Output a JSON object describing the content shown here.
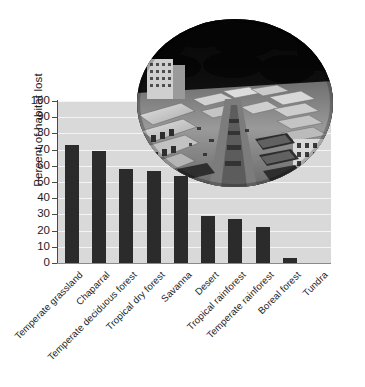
{
  "chart_data": {
    "type": "bar",
    "title": "",
    "xlabel": "",
    "ylabel": "Percent of habitat lost",
    "ylim": [
      0,
      100
    ],
    "ytick_step": 10,
    "yticks": [
      100,
      90,
      80,
      70,
      60,
      50,
      40,
      30,
      20,
      10,
      0
    ],
    "grid": "horizontal",
    "legend": "none",
    "categories": [
      "Temperate grassland",
      "Chaparral",
      "Temperate deciduous forest",
      "Tropical dry forest",
      "Savanna",
      "Desert",
      "Tropical rainforest",
      "Temperate rainforest",
      "Boreal forest",
      "Tundra"
    ],
    "values": [
      73,
      69,
      58,
      57,
      54,
      29,
      27,
      22,
      3,
      0
    ],
    "series": [
      {
        "name": "Percent of habitat lost",
        "values": [
          73,
          69,
          58,
          57,
          54,
          29,
          27,
          22,
          3,
          0
        ]
      }
    ],
    "bar_color": "#2b2b2b",
    "plot_background": "#d9d9d9",
    "gridline_color": "#f4f4f4"
  },
  "inset": {
    "name": "habitat-loss-photo",
    "shape": "ellipse",
    "description": "Black and white aerial photograph of urban construction clearing at a forest edge",
    "palette": {
      "canopy": "#0d0d0d",
      "ground": "#8e8e8e",
      "building": "#d5d5d5",
      "shadow": "#3a3a3a"
    }
  },
  "colors": {
    "axis": "#4a4a4a",
    "text": "#1c1c1c",
    "page_background": "#ffffff"
  }
}
